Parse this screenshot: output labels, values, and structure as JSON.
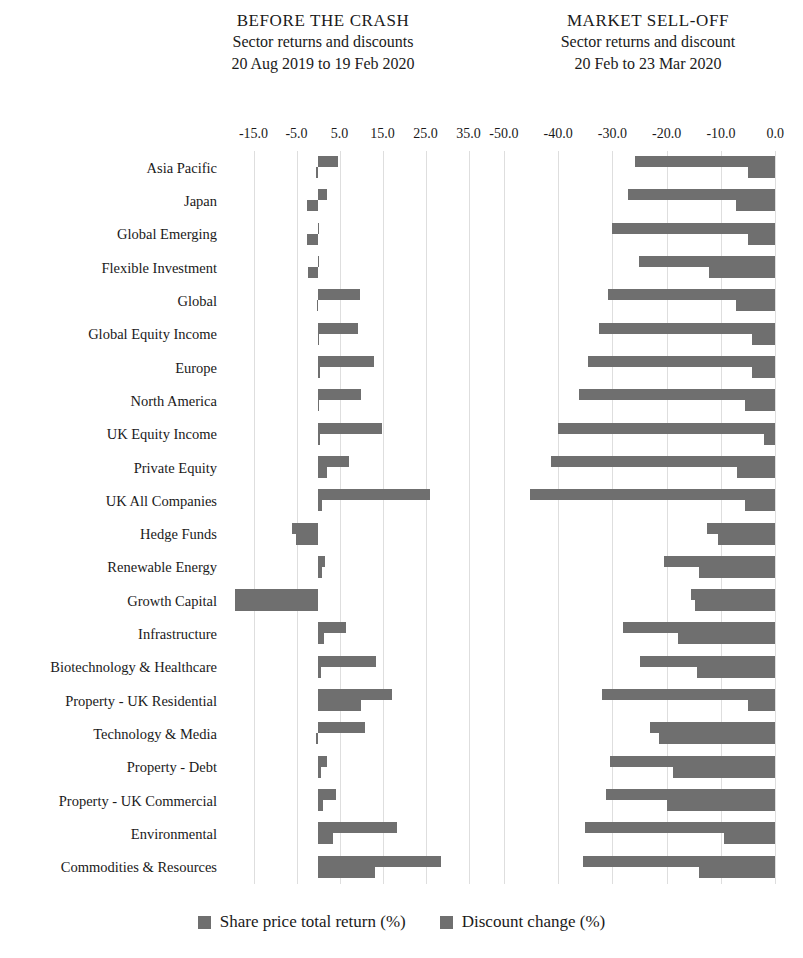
{
  "panels": {
    "left": {
      "title": "BEFORE THE CRASH",
      "subtitle": "Sector returns and discounts",
      "period": "20 Aug 2019 to 19 Feb 2020"
    },
    "right": {
      "title": "MARKET SELL-OFF",
      "subtitle": "Sector returns and discount",
      "period": "20 Feb to 23 Mar 2020"
    }
  },
  "legend": {
    "items": [
      {
        "label": "Share price total return (%)",
        "color": "#6f6f6f"
      },
      {
        "label": "Discount change (%)",
        "color": "#6f6f6f"
      }
    ]
  },
  "axes": {
    "left": {
      "ticks": [
        "-15.0",
        "-5.0",
        "5.0",
        "15.0",
        "25.0",
        "35.0"
      ],
      "tick_values": [
        -15,
        -5,
        5,
        15,
        25,
        35
      ],
      "min": -20.0,
      "max": 40.0
    },
    "right": {
      "ticks": [
        "-50.0",
        "-40.0",
        "-30.0",
        "-20.0",
        "-10.0",
        "0.0"
      ],
      "tick_values": [
        -50,
        -40,
        -30,
        -20,
        -10,
        0
      ],
      "min": -52.0,
      "max": 0.5
    }
  },
  "chart_data": {
    "type": "bar",
    "orientation": "horizontal",
    "grid": true,
    "legend_position": "bottom",
    "xlabel": "",
    "ylabel": "",
    "categories": [
      "Asia Pacific",
      "Japan",
      "Global Emerging",
      "Flexible Investment",
      "Global",
      "Global Equity Income",
      "Europe",
      "North America",
      "UK Equity Income",
      "Private Equity",
      "UK All Companies",
      "Hedge Funds",
      "Renewable Energy",
      "Growth Capital",
      "Infrastructure",
      "Biotechnology & Healthcare",
      "Property - UK Residential",
      "Technology & Media",
      "Property - Debt",
      "Property - UK Commercial",
      "Environmental",
      "Commodities & Resources"
    ],
    "panels": [
      {
        "name": "BEFORE THE CRASH",
        "xlim": [
          -20.0,
          40.0
        ],
        "xticks": [
          -15,
          -5,
          5,
          15,
          25,
          35
        ],
        "series": [
          {
            "name": "Share price total return (%)",
            "color": "#6f6f6f",
            "values": [
              4.6,
              2.0,
              0.2,
              0.0,
              9.8,
              9.4,
              13.0,
              9.9,
              14.9,
              7.3,
              26.1,
              -6.0,
              1.6,
              -19.2,
              6.4,
              13.5,
              17.3,
              11.0,
              2.2,
              4.3,
              18.3,
              28.5
            ]
          },
          {
            "name": "Discount change (%)",
            "color": "#6f6f6f",
            "values": [
              -0.4,
              -2.6,
              -2.6,
              -2.3,
              -0.3,
              0.3,
              0.4,
              0.2,
              0.5,
              2.2,
              0.9,
              -5.2,
              0.9,
              -19.2,
              1.5,
              0.7,
              9.9,
              -0.5,
              0.6,
              1.1,
              3.6,
              13.3
            ]
          }
        ]
      },
      {
        "name": "MARKET SELL-OFF",
        "xlim": [
          -52.0,
          0.5
        ],
        "xticks": [
          -50,
          -40,
          -30,
          -20,
          -10,
          0
        ],
        "series": [
          {
            "name": "Share price total return (%)",
            "color": "#6f6f6f",
            "values": [
              -25.8,
              -27.2,
              -30.0,
              -25.1,
              -30.8,
              -32.4,
              -34.5,
              -36.1,
              -40.0,
              -41.3,
              -45.2,
              -12.5,
              -20.5,
              -15.5,
              -28.0,
              -25.0,
              -32.0,
              -23.0,
              -30.5,
              -31.2,
              -35.0,
              -35.5
            ]
          },
          {
            "name": "Discount change (%)",
            "color": "#6f6f6f",
            "values": [
              -5.0,
              -7.2,
              -5.0,
              -12.3,
              -7.2,
              -4.2,
              -4.2,
              -5.5,
              -2.0,
              -7.0,
              -5.5,
              -10.5,
              -14.0,
              -14.8,
              -18.0,
              -14.5,
              -5.0,
              -21.5,
              -18.8,
              -20.0,
              -9.5,
              -14.0
            ]
          }
        ]
      }
    ]
  }
}
